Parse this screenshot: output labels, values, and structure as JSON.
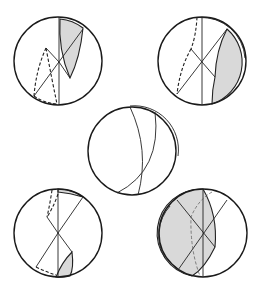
{
  "figure": {
    "colors": {
      "stroke": "#1a1a1a",
      "shade": "#d9d9d9",
      "background": "#ffffff"
    },
    "panels": [
      {
        "id": "top-left",
        "center": [
          58,
          61
        ],
        "radius": 44,
        "shaded": "narrow lens upper right",
        "dashed": "lower left wedge"
      },
      {
        "id": "top-right",
        "center": [
          202,
          61
        ],
        "radius": 44,
        "shaded": "lower right crescent",
        "dashed": "left arc"
      },
      {
        "id": "center",
        "center": [
          132,
          151
        ],
        "radius": 44,
        "shaded": "none",
        "dashed": "none"
      },
      {
        "id": "bottom-left",
        "center": [
          58,
          233
        ],
        "radius": 44,
        "shaded": "small lens lower center and thin sliver top",
        "dashed": "upper left and lower left"
      },
      {
        "id": "bottom-right",
        "center": [
          203,
          233
        ],
        "radius": 44,
        "shaded": "large left region",
        "dashed": "faint inner trace"
      }
    ]
  }
}
